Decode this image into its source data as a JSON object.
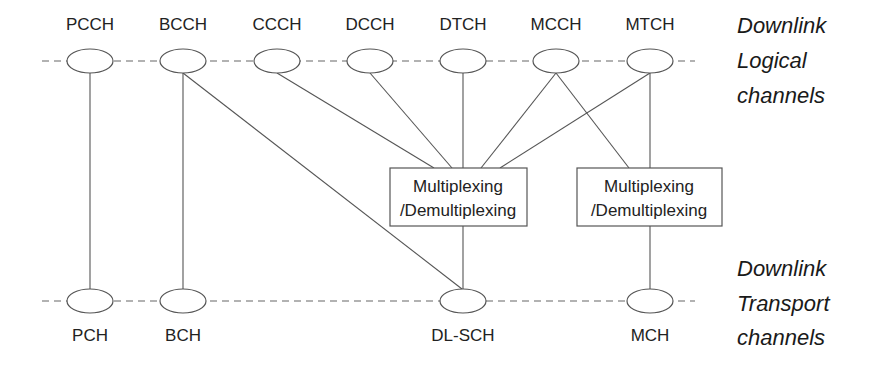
{
  "logical_layer": {
    "label_lines": [
      "Downlink",
      "Logical",
      "channels"
    ],
    "channels": [
      {
        "name": "PCCH",
        "x": 90
      },
      {
        "name": "BCCH",
        "x": 183
      },
      {
        "name": "CCCH",
        "x": 277
      },
      {
        "name": "DCCH",
        "x": 370
      },
      {
        "name": "DTCH",
        "x": 463
      },
      {
        "name": "MCCH",
        "x": 556
      },
      {
        "name": "MTCH",
        "x": 650
      }
    ]
  },
  "transport_layer": {
    "label_lines": [
      "Downlink",
      "Transport",
      "channels"
    ],
    "channels": [
      {
        "name": "PCH",
        "x": 90
      },
      {
        "name": "BCH",
        "x": 183
      },
      {
        "name": "DL-SCH",
        "x": 463
      },
      {
        "name": "MCH",
        "x": 650
      }
    ]
  },
  "mux_boxes": [
    {
      "id": "mux-dlsch",
      "line1": "Multiplexing",
      "line2": "/Demultiplexing"
    },
    {
      "id": "mux-mch",
      "line1": "Multiplexing",
      "line2": "/Demultiplexing"
    }
  ],
  "connections": [
    [
      "PCCH",
      "PCH"
    ],
    [
      "BCCH",
      "BCH"
    ],
    [
      "BCCH",
      "DL-SCH"
    ],
    [
      "CCCH",
      "mux-dlsch"
    ],
    [
      "DCCH",
      "mux-dlsch"
    ],
    [
      "DTCH",
      "mux-dlsch"
    ],
    [
      "MCCH",
      "mux-dlsch"
    ],
    [
      "MTCH",
      "mux-dlsch"
    ],
    [
      "MCCH",
      "mux-mch"
    ],
    [
      "MTCH",
      "mux-mch"
    ],
    [
      "mux-dlsch",
      "DL-SCH"
    ],
    [
      "mux-mch",
      "MCH"
    ]
  ]
}
